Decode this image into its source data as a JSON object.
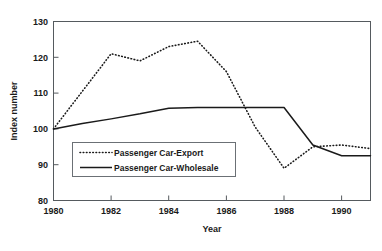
{
  "chart_data": {
    "type": "line",
    "title": "",
    "xlabel": "Year",
    "ylabel": "Index number",
    "xlim": [
      1980,
      1991
    ],
    "ylim": [
      80,
      130
    ],
    "ytick_labels": [
      "130",
      "120",
      "110",
      "100",
      "90",
      "80"
    ],
    "ytick_values": [
      130,
      120,
      110,
      100,
      90,
      80
    ],
    "xtick_labels": [
      "1980",
      "1982",
      "1984",
      "1986",
      "1988",
      "1990"
    ],
    "xtick_values": [
      1980,
      1982,
      1984,
      1986,
      1988,
      1990
    ],
    "grid": false,
    "legend_position": "center-left",
    "x": [
      1980,
      1981,
      1982,
      1983,
      1984,
      1985,
      1986,
      1987,
      1988,
      1989,
      1990,
      1991
    ],
    "series": [
      {
        "name": "Passenger Car-Export",
        "style": "dotted",
        "color": "#1a1a1a",
        "values": [
          100.0,
          110.5,
          121.0,
          119.0,
          123.0,
          124.5,
          116.0,
          100.5,
          89.0,
          95.0,
          95.5,
          94.5
        ]
      },
      {
        "name": "Passenger Car-Wholesale",
        "style": "solid",
        "color": "#1a1a1a",
        "values": [
          100.0,
          101.5,
          102.8,
          104.2,
          105.8,
          106.0,
          106.0,
          106.0,
          106.0,
          95.5,
          92.5,
          92.5
        ]
      }
    ]
  },
  "axes": {
    "y_title": "Index number",
    "x_title": "Year",
    "y_ticks": [
      "130",
      "120",
      "110",
      "100",
      "90",
      "80"
    ],
    "x_ticks": [
      "1980",
      "1982",
      "1984",
      "1986",
      "1988",
      "1990"
    ]
  },
  "legend": {
    "entries": [
      {
        "label": "Passenger Car-Export",
        "style": "dotted"
      },
      {
        "label": "Passenger Car-Wholesale",
        "style": "solid"
      }
    ]
  },
  "colors": {
    "line": "#1a1a1a",
    "frame": "#555a5e",
    "background": "#ffffff"
  }
}
